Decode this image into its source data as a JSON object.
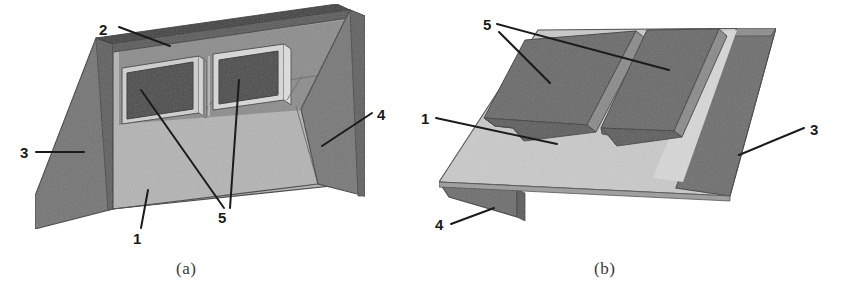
{
  "figure": {
    "type": "technical-line-drawing",
    "panels": [
      {
        "id": "a",
        "caption": "(a)",
        "view": "front-isometric-concave",
        "callouts": [
          {
            "id": "c2",
            "label": "2",
            "x": 105,
            "y": 30,
            "target_x": 168,
            "target_y": 46,
            "desc": "top-edge-rim"
          },
          {
            "id": "c3",
            "label": "3",
            "x": 24,
            "y": 157,
            "target_x": 80,
            "target_y": 151,
            "desc": "left-flange"
          },
          {
            "id": "c4",
            "label": "4",
            "x": 383,
            "y": 115,
            "target_x": 320,
            "target_y": 145,
            "desc": "right-flange"
          },
          {
            "id": "c1",
            "label": "1",
            "x": 137,
            "y": 243,
            "target_x": 148,
            "target_y": 190,
            "desc": "main-web-face"
          },
          {
            "id": "c5",
            "label": "5",
            "x": 222,
            "y": 222,
            "target_x_1": 137,
            "target_y_1": 88,
            "target_x_2": 237,
            "target_y_2": 79,
            "desc": "recessed-windows"
          }
        ]
      },
      {
        "id": "b",
        "caption": "(b)",
        "view": "rear-isometric-convex",
        "callouts": [
          {
            "id": "c5b",
            "label": "5",
            "x": 489,
            "y": 30,
            "target_x_1": 545,
            "target_y_1": 80,
            "target_x_2": 665,
            "target_y_2": 70,
            "desc": "raised-channel-ribs"
          },
          {
            "id": "c1b",
            "label": "1",
            "x": 421,
            "y": 124,
            "target_x": 555,
            "target_y": 143,
            "desc": "main-web-face"
          },
          {
            "id": "c4b",
            "label": "4",
            "x": 437,
            "y": 228,
            "target_x": 492,
            "target_y": 208,
            "desc": "front-flange"
          },
          {
            "id": "c3b",
            "label": "3",
            "x": 813,
            "y": 136,
            "target_x": 740,
            "target_y": 155,
            "desc": "right-flange"
          }
        ]
      }
    ],
    "colors": {
      "background": "#ffffff",
      "light_face": "#b2b2b2",
      "light_face_b": "#c6c6c6",
      "mid_face": "#8f8f8f",
      "flange_dark": "#6e6e6e",
      "recess_dark": "#4a4a4a",
      "rib_dark": "#616161",
      "edge_line": "#3c3c3c",
      "label_ink": "#1b1b1b",
      "caption_ink": "#3a3a3a",
      "top_rim": "#3f3f3f"
    },
    "legend_numbers": [
      "1",
      "2",
      "3",
      "4",
      "5"
    ]
  }
}
